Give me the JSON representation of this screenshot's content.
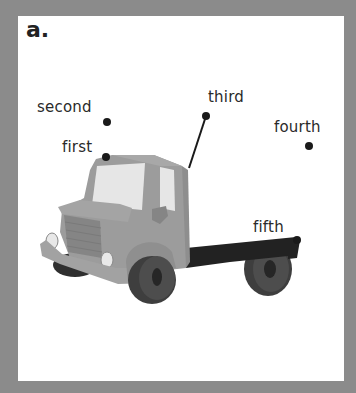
{
  "figure": {
    "heading": "a.",
    "labels": [
      {
        "id": "second",
        "text": "second"
      },
      {
        "id": "first",
        "text": "first"
      },
      {
        "id": "third",
        "text": "third"
      },
      {
        "id": "fourth",
        "text": "fourth"
      },
      {
        "id": "fifth",
        "text": "fifth"
      }
    ]
  },
  "colors": {
    "border": "#8b8b8b",
    "panel": "#ffffff",
    "truck_body": "#9a9a9a",
    "truck_dark": "#7c7c7c",
    "window": "#e6e6e6",
    "chassis": "#222222",
    "tire": "#4a4a4a",
    "dot": "#1a1a1a"
  }
}
